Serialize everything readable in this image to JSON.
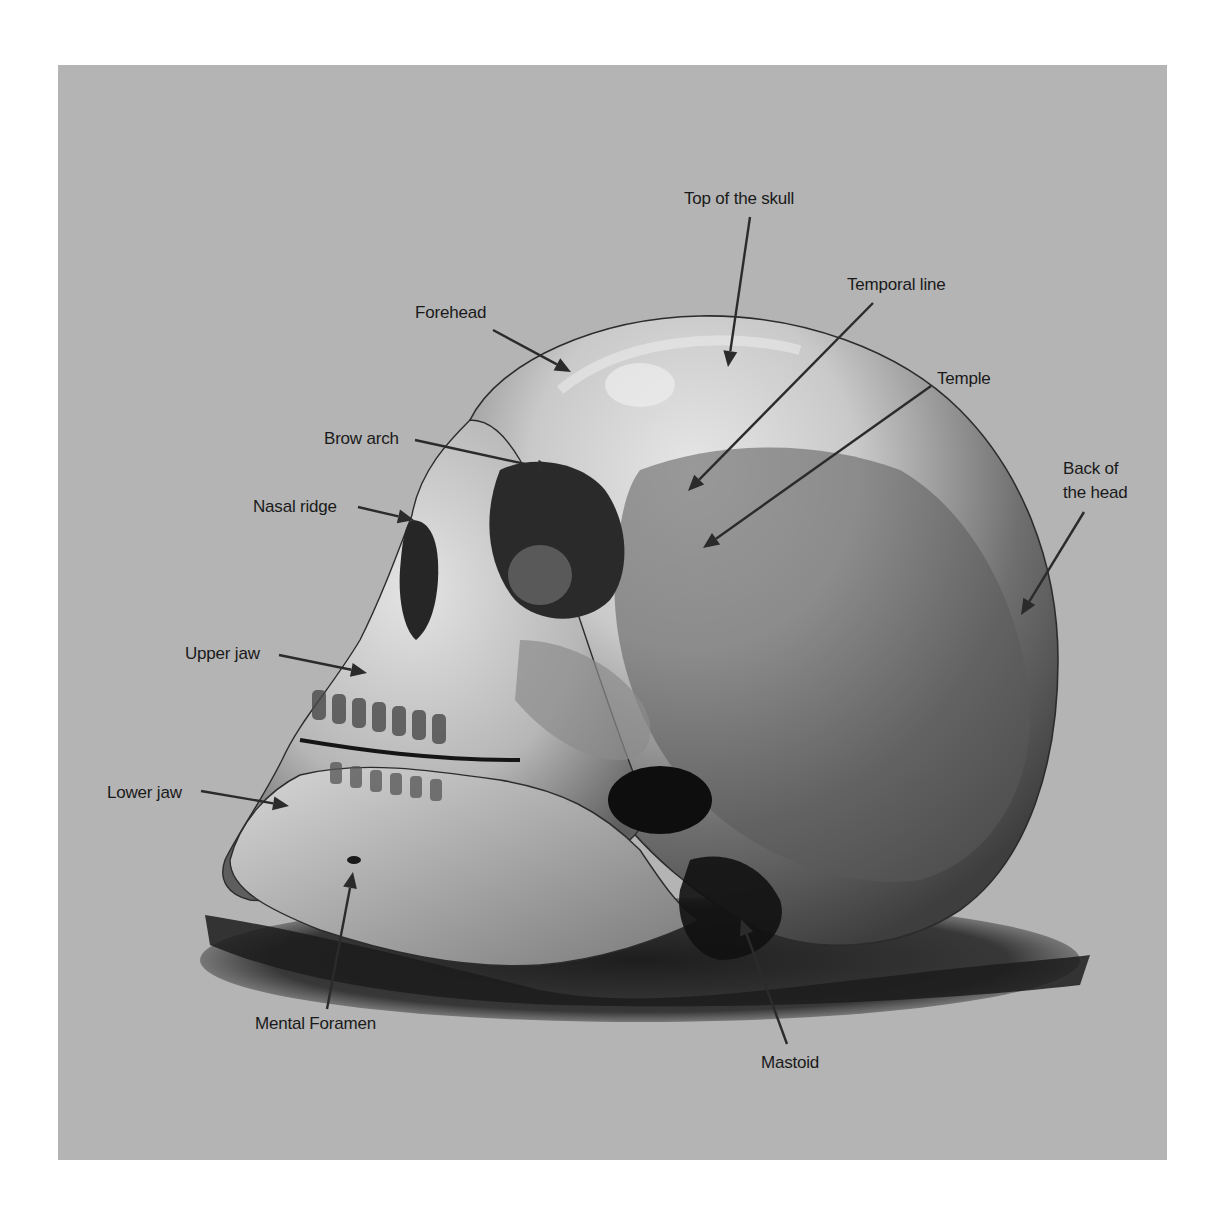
{
  "figure": {
    "background_color": "#b4b4b4",
    "page_color": "#ffffff",
    "panel": {
      "x": 58,
      "y": 65,
      "width": 1109,
      "height": 1095
    }
  },
  "labels": [
    {
      "id": "top-of-the-skull",
      "text": "Top of the skull",
      "lines": [
        "Top of the skull"
      ],
      "x": 684,
      "y": 204,
      "anchor": "start",
      "arrow": {
        "from": [
          750,
          217
        ],
        "to": [
          728,
          367
        ]
      }
    },
    {
      "id": "temporal-line",
      "text": "Temporal line",
      "lines": [
        "Temporal line"
      ],
      "x": 847,
      "y": 290,
      "anchor": "start",
      "arrow": {
        "from": [
          873,
          303
        ],
        "to": [
          688,
          491
        ]
      }
    },
    {
      "id": "forehead",
      "text": "Forehead",
      "lines": [
        "Forehead"
      ],
      "x": 415,
      "y": 318,
      "anchor": "start",
      "arrow": {
        "from": [
          493,
          330
        ],
        "to": [
          571,
          372
        ]
      }
    },
    {
      "id": "temple",
      "text": "Temple",
      "lines": [
        "Temple"
      ],
      "x": 937,
      "y": 384,
      "anchor": "start",
      "arrow": {
        "from": [
          931,
          386
        ],
        "to": [
          703,
          548
        ]
      }
    },
    {
      "id": "brow-arch",
      "text": "Brow arch",
      "lines": [
        "Brow arch"
      ],
      "x": 324,
      "y": 444,
      "anchor": "start",
      "arrow": {
        "from": [
          415,
          440
        ],
        "to": [
          553,
          470
        ]
      }
    },
    {
      "id": "back-of-the-head",
      "text": "Back of the head",
      "lines": [
        "Back of",
        "the head"
      ],
      "x": 1063,
      "y": 474,
      "anchor": "start",
      "line_height": 24,
      "arrow": {
        "from": [
          1084,
          512
        ],
        "to": [
          1021,
          615
        ]
      }
    },
    {
      "id": "nasal-ridge",
      "text": "Nasal ridge",
      "lines": [
        "Nasal ridge"
      ],
      "x": 253,
      "y": 512,
      "anchor": "start",
      "arrow": {
        "from": [
          358,
          507
        ],
        "to": [
          414,
          520
        ]
      }
    },
    {
      "id": "upper-jaw",
      "text": "Upper jaw",
      "lines": [
        "Upper jaw"
      ],
      "x": 185,
      "y": 659,
      "anchor": "start",
      "arrow": {
        "from": [
          279,
          655
        ],
        "to": [
          367,
          673
        ]
      }
    },
    {
      "id": "lower-jaw",
      "text": "Lower jaw",
      "lines": [
        "Lower jaw"
      ],
      "x": 107,
      "y": 798,
      "anchor": "start",
      "arrow": {
        "from": [
          201,
          791
        ],
        "to": [
          289,
          806
        ]
      }
    },
    {
      "id": "mental-foramen",
      "text": "Mental Foramen",
      "lines": [
        "Mental Foramen"
      ],
      "x": 255,
      "y": 1029,
      "anchor": "start",
      "arrow": {
        "from": [
          327,
          1009
        ],
        "to": [
          353,
          872
        ]
      }
    },
    {
      "id": "mastoid",
      "text": "Mastoid",
      "lines": [
        "Mastoid"
      ],
      "x": 761,
      "y": 1068,
      "anchor": "start",
      "arrow": {
        "from": [
          787,
          1044
        ],
        "to": [
          741,
          919
        ]
      }
    }
  ]
}
